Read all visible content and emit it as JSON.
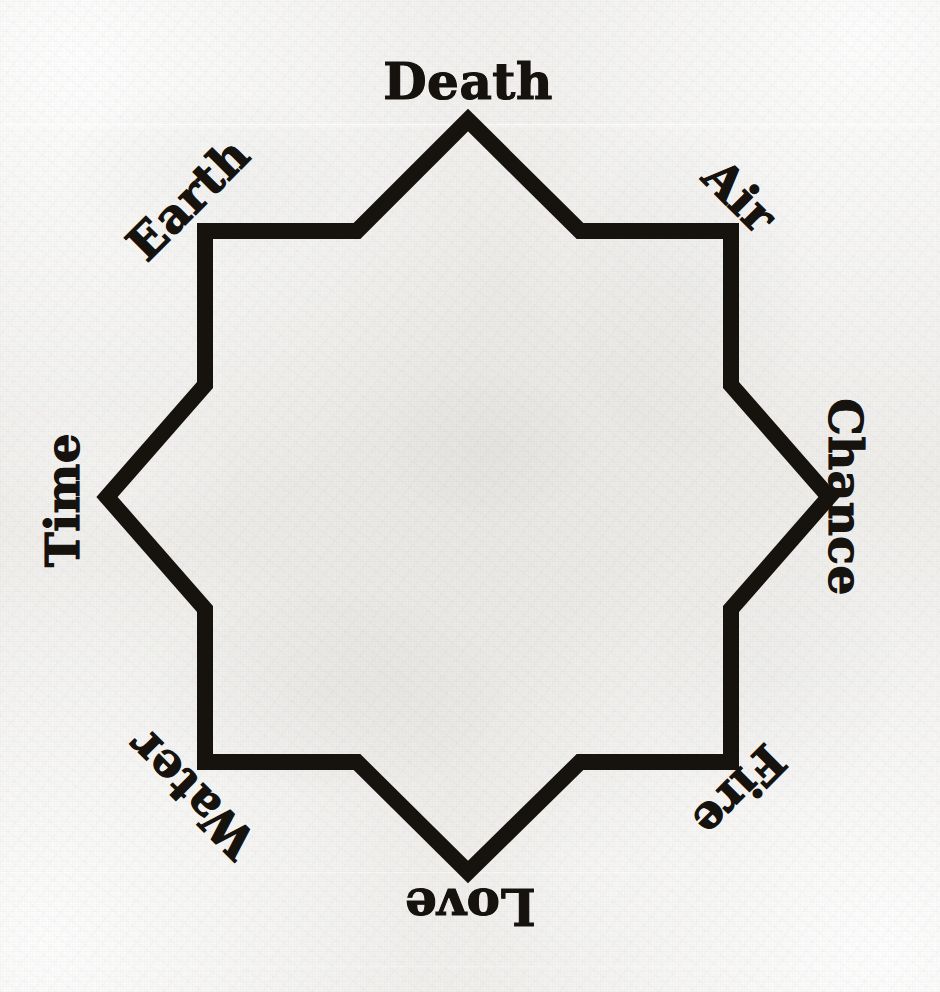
{
  "figure": {
    "type": "octagram-diagram",
    "background_color": "#eeedea",
    "ink_color": "#16130f",
    "stroke_width_px": 16,
    "center": {
      "x": 468,
      "y": 497
    },
    "outer_radius_px": 377,
    "inner_radius_px": 264
  },
  "labels": [
    {
      "text": "Death",
      "position": "top",
      "angle_deg": 0,
      "rotation_deg": 0,
      "x": 468,
      "y": 82,
      "font_size": 50
    },
    {
      "text": "Air",
      "position": "upper-right",
      "angle_deg": 45,
      "rotation_deg": 45,
      "x": 740,
      "y": 196,
      "font_size": 47
    },
    {
      "text": "Chance",
      "position": "right",
      "angle_deg": 90,
      "rotation_deg": 90,
      "x": 845,
      "y": 497,
      "font_size": 47
    },
    {
      "text": "Fire",
      "position": "lower-right",
      "angle_deg": 135,
      "rotation_deg": 135,
      "x": 739,
      "y": 791,
      "font_size": 47
    },
    {
      "text": "Love",
      "position": "bottom",
      "angle_deg": 180,
      "rotation_deg": 180,
      "x": 470,
      "y": 906,
      "font_size": 50
    },
    {
      "text": "Water",
      "position": "lower-left",
      "angle_deg": 225,
      "rotation_deg": 225,
      "x": 191,
      "y": 794,
      "font_size": 47
    },
    {
      "text": "Time",
      "position": "left",
      "angle_deg": 270,
      "rotation_deg": 270,
      "x": 62,
      "y": 500,
      "font_size": 47
    },
    {
      "text": "Earth",
      "position": "upper-left",
      "angle_deg": 315,
      "rotation_deg": 315,
      "x": 188,
      "y": 199,
      "font_size": 47
    }
  ],
  "star_points": [
    {
      "name": "outer-n",
      "x": 468,
      "y": 120
    },
    {
      "name": "inner-nne",
      "x": 580,
      "y": 231
    },
    {
      "name": "outer-ne",
      "x": 731,
      "y": 231
    },
    {
      "name": "inner-ene",
      "x": 731,
      "y": 385
    },
    {
      "name": "outer-e",
      "x": 829,
      "y": 497
    },
    {
      "name": "inner-ese",
      "x": 731,
      "y": 609
    },
    {
      "name": "outer-se",
      "x": 731,
      "y": 762
    },
    {
      "name": "inner-sse",
      "x": 580,
      "y": 762
    },
    {
      "name": "outer-s",
      "x": 468,
      "y": 872
    },
    {
      "name": "inner-ssw",
      "x": 357,
      "y": 762
    },
    {
      "name": "outer-sw",
      "x": 205,
      "y": 762
    },
    {
      "name": "inner-wsw",
      "x": 205,
      "y": 609
    },
    {
      "name": "outer-w",
      "x": 107,
      "y": 497
    },
    {
      "name": "inner-wnw",
      "x": 205,
      "y": 385
    },
    {
      "name": "outer-nw",
      "x": 205,
      "y": 231
    },
    {
      "name": "inner-nnw",
      "x": 357,
      "y": 231
    }
  ],
  "scratches": [
    {
      "y": 124,
      "opacity": "bright"
    },
    {
      "y": 126,
      "opacity": "dim"
    },
    {
      "y": 872,
      "opacity": "dim"
    },
    {
      "y": 966,
      "opacity": "dim"
    }
  ]
}
